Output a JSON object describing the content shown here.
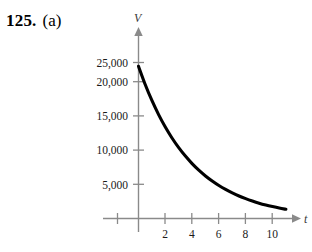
{
  "problem": {
    "number": "125.",
    "part": "(a)"
  },
  "chart_data": {
    "type": "line",
    "title": "",
    "xlabel": "t",
    "ylabel": "V",
    "xlim": [
      -1.6,
      12.2
    ],
    "ylim": [
      0,
      27500
    ],
    "grid": false,
    "legend": null,
    "x_ticks": [
      2,
      4,
      6,
      8,
      10
    ],
    "x_tick_labels": [
      "2",
      "4",
      "6",
      "8",
      "10"
    ],
    "y_ticks": [
      5000,
      10000,
      15000,
      20000,
      25000
    ],
    "y_tick_labels": [
      "5,000",
      "10,000",
      "15,000",
      "20,000",
      "25,000"
    ],
    "series": [
      {
        "name": "V",
        "x": [
          0,
          0.5,
          1,
          1.5,
          2,
          2.5,
          3,
          3.5,
          4,
          4.5,
          5,
          5.5,
          6,
          6.5,
          7,
          7.5,
          8,
          8.5,
          9,
          9.5,
          10,
          10.5,
          11
        ],
        "values": [
          25000,
          22010,
          19380,
          17060,
          15020,
          13220,
          11640,
          10250,
          9020,
          7940,
          6990,
          6160,
          5420,
          4770,
          4200,
          3700,
          3260,
          2870,
          2520,
          2220,
          1960,
          1720,
          1510
        ]
      }
    ],
    "annotations": []
  }
}
